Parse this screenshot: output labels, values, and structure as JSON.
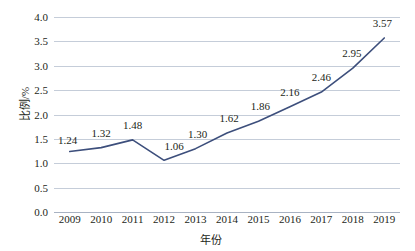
{
  "chart_data": {
    "type": "line",
    "title": "",
    "xlabel": "年份",
    "ylabel": "比例/%",
    "categories": [
      "2009",
      "2010",
      "2011",
      "2012",
      "2013",
      "2014",
      "2015",
      "2016",
      "2017",
      "2018",
      "2019"
    ],
    "values": [
      1.24,
      1.32,
      1.48,
      1.06,
      1.3,
      1.62,
      1.86,
      2.16,
      2.46,
      2.95,
      3.57
    ],
    "point_labels": [
      "1.24",
      "1.32",
      "1.48",
      "1.06",
      "1.30",
      "1.62",
      "1.86",
      "2.16",
      "2.46",
      "2.95",
      "3.57"
    ],
    "ylim": [
      0.0,
      4.0
    ],
    "ytick_values": [
      0.0,
      0.5,
      1.0,
      1.5,
      2.0,
      2.5,
      3.0,
      3.5,
      4.0
    ],
    "ytick_labels": [
      "0.0",
      "0.5",
      "1.0",
      "1.5",
      "2.0",
      "2.5",
      "3.0",
      "3.5",
      "4.0"
    ],
    "grid": true,
    "legend": false,
    "series": [
      {
        "name": "比例/%",
        "values": [
          1.24,
          1.32,
          1.48,
          1.06,
          1.3,
          1.62,
          1.86,
          2.16,
          2.46,
          2.95,
          3.57
        ]
      }
    ],
    "colors": {
      "line": "#3d4f7c",
      "grid": "#c5cdd9",
      "axis": "#a8b2c2",
      "text": "#231f20",
      "background": "#ffffff"
    }
  }
}
